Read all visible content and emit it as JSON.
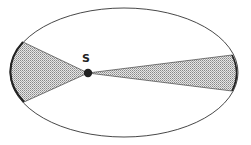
{
  "diagram": {
    "labels": {
      "sun": "S"
    },
    "orbit": {
      "cx": 124,
      "cy": 72.5,
      "rx": 114,
      "ry": 64.5,
      "stroke": "#333333"
    },
    "sun": {
      "x": 88,
      "y": 73,
      "r": 4,
      "fill": "#222222"
    },
    "sectors": [
      {
        "name": "near-perihelion",
        "start": [
          23,
          42
        ],
        "end": [
          24,
          102
        ],
        "fill": "dotted-gray"
      },
      {
        "name": "near-aphelion",
        "start": [
          232,
          55
        ],
        "end": [
          232,
          91
        ],
        "fill": "dotted-gray"
      }
    ]
  }
}
